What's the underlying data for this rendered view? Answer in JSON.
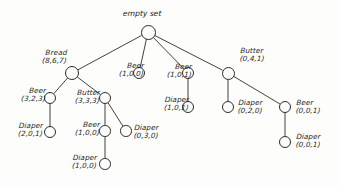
{
  "diagram": {
    "type": "tree",
    "title": "empty set",
    "root": {
      "id": "root",
      "label": "empty set",
      "x": 148,
      "y": 32,
      "r": 7.5
    },
    "nodes": [
      {
        "id": "bread",
        "name": "Bread",
        "count": "(8,6,7)",
        "x": 72,
        "y": 73,
        "r": 7.0,
        "label_x": 33,
        "label_y": 49,
        "align": "ta-right"
      },
      {
        "id": "beer_b1",
        "name": "Beer",
        "count": "(3,2,3)",
        "x": 50,
        "y": 98,
        "r": 6.0,
        "label_x": 12,
        "label_y": 87,
        "align": "ta-right"
      },
      {
        "id": "diaper_b1",
        "name": "Diaper",
        "count": "(2,0,1)",
        "x": 50,
        "y": 132,
        "r": 6.0,
        "label_x": 9,
        "label_y": 122,
        "align": "ta-right"
      },
      {
        "id": "butter_b",
        "name": "Butter",
        "count": "(3,3,3)",
        "x": 105,
        "y": 98,
        "r": 6.2,
        "label_x": 66,
        "label_y": 89,
        "align": "ta-right"
      },
      {
        "id": "beer_b2",
        "name": "Beer",
        "count": "(1,0,0)",
        "x": 105,
        "y": 131,
        "r": 5.8,
        "label_x": 66,
        "label_y": 121,
        "align": "ta-right"
      },
      {
        "id": "diaper_b2",
        "name": "Diaper",
        "count": "(1,0,0)",
        "x": 105,
        "y": 164,
        "r": 5.8,
        "label_x": 63,
        "label_y": 154,
        "align": "ta-right"
      },
      {
        "id": "diaper_b3",
        "name": "Diaper",
        "count": "(0,3,0)",
        "x": 126,
        "y": 131,
        "r": 5.8,
        "label_x": 134,
        "label_y": 124,
        "align": "ta-left"
      },
      {
        "id": "beer_m1",
        "name": "Beer",
        "count": "(1,0,0)",
        "x": 139,
        "y": 73,
        "r": 6.2,
        "label_x": 110,
        "label_y": 62,
        "align": "ta-right"
      },
      {
        "id": "beer_m2",
        "name": "Beer",
        "count": "(1,0,1)",
        "x": 188,
        "y": 73,
        "r": 6.2,
        "label_x": 158,
        "label_y": 63,
        "align": "ta-right"
      },
      {
        "id": "diaper_m2",
        "name": "Diaper",
        "count": "(1,0,1)",
        "x": 188,
        "y": 107,
        "r": 6.2,
        "label_x": 155,
        "label_y": 96,
        "align": "ta-right"
      },
      {
        "id": "butter_r",
        "name": "Butter",
        "count": "(0,4,1)",
        "x": 228,
        "y": 73,
        "r": 6.5,
        "label_x": 240,
        "label_y": 47,
        "align": "ta-left"
      },
      {
        "id": "diaper_r1",
        "name": "Diaper",
        "count": "(0,2,0)",
        "x": 228,
        "y": 107,
        "r": 6.0,
        "label_x": 238,
        "label_y": 99,
        "align": "ta-left"
      },
      {
        "id": "beer_r2",
        "name": "Beer",
        "count": "(0,0,1)",
        "x": 285,
        "y": 107,
        "r": 6.0,
        "label_x": 296,
        "label_y": 99,
        "align": "ta-left"
      },
      {
        "id": "diaper_r2",
        "name": "Diaper",
        "count": "(0,0,1)",
        "x": 285,
        "y": 142,
        "r": 6.0,
        "label_x": 296,
        "label_y": 133,
        "align": "ta-left"
      }
    ],
    "edges": [
      {
        "from": "root",
        "to": "bread"
      },
      {
        "from": "root",
        "to": "beer_m1"
      },
      {
        "from": "root",
        "to": "beer_m2"
      },
      {
        "from": "root",
        "to": "butter_r"
      },
      {
        "from": "bread",
        "to": "beer_b1"
      },
      {
        "from": "bread",
        "to": "butter_b"
      },
      {
        "from": "beer_b1",
        "to": "diaper_b1"
      },
      {
        "from": "butter_b",
        "to": "beer_b2"
      },
      {
        "from": "butter_b",
        "to": "diaper_b3"
      },
      {
        "from": "beer_b2",
        "to": "diaper_b2"
      },
      {
        "from": "beer_m2",
        "to": "diaper_m2"
      },
      {
        "from": "butter_r",
        "to": "diaper_r1"
      },
      {
        "from": "butter_r",
        "to": "beer_r2"
      },
      {
        "from": "beer_r2",
        "to": "diaper_r2"
      }
    ],
    "colors": {
      "stroke": "#2b2b2b",
      "text": "#1d1d1d",
      "background": "#fdfdfc"
    }
  }
}
